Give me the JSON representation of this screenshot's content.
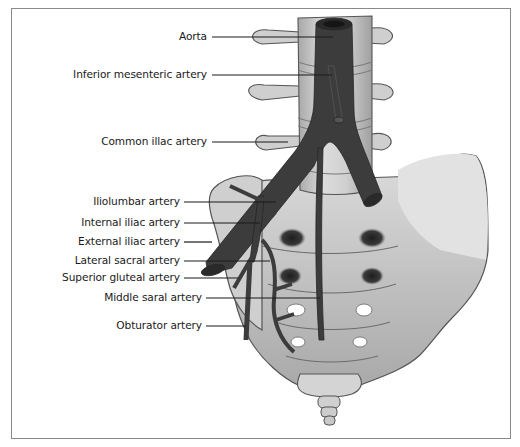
{
  "figure": {
    "colors": {
      "artery": "#3c3c3c",
      "bone_light": "#d9d9d9",
      "bone_mid": "#bdbdbd",
      "bone_dark": "#9a9a9a",
      "outline": "#555555",
      "frame": "#8a8a8a",
      "leader_line": "#1a1a1a"
    },
    "labels": [
      {
        "id": "aorta",
        "text": "Aorta",
        "right": 207,
        "y": 36
      },
      {
        "id": "inferior-mesenteric",
        "text": "Inferior mesenteric artery",
        "right": 207,
        "y": 74
      },
      {
        "id": "common-iliac",
        "text": "Common illac artery",
        "right": 207,
        "y": 141
      },
      {
        "id": "iliolumbar",
        "text": "Iliolumbar artery",
        "right": 180,
        "y": 201
      },
      {
        "id": "internal-iliac",
        "text": "Internal iliac artery",
        "right": 180,
        "y": 222
      },
      {
        "id": "external-iliac",
        "text": "External iliac artery",
        "right": 180,
        "y": 241
      },
      {
        "id": "lateral-sacral",
        "text": "Lateral sacral artery",
        "right": 180,
        "y": 260
      },
      {
        "id": "superior-gluteal",
        "text": "Superior gluteal artery",
        "right": 180,
        "y": 277
      },
      {
        "id": "middle-sacral",
        "text": "Middle saral artery",
        "right": 202,
        "y": 297
      },
      {
        "id": "obturator",
        "text": "Obturator artery",
        "right": 202,
        "y": 325
      }
    ]
  }
}
